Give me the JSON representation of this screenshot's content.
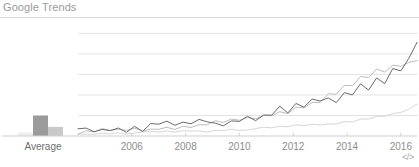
{
  "widget": {
    "title": "Google Trends",
    "embed_icon_label": "</>",
    "embed_icon_name": "code-embed-icon"
  },
  "colors": {
    "title": "#9a9a9a",
    "rule": "#d9d9d9",
    "gridline": "#e3e3e3",
    "axis": "#cfcfcf",
    "tick_label": "#8d8d8d",
    "bar_dark": "#9b9b9b",
    "bar_mid": "#c9c9c9",
    "bar_faint": "#efefef",
    "series_dark": "#6b6b6b",
    "series_mid": "#bdbdbd",
    "series_pale": "#d6d6d6"
  },
  "chart_data": {
    "type": "line",
    "title": "Google Trends",
    "xlabel": "",
    "ylabel": "",
    "grid": true,
    "legend": "none",
    "xlim": [
      2004.0,
      2016.6
    ],
    "ylim": [
      0,
      100
    ],
    "gridline_values": [
      90,
      72,
      54,
      36,
      18
    ],
    "xticks": [
      2006,
      2008,
      2010,
      2012,
      2014,
      2016
    ],
    "xticklabels": [
      "2006",
      "2008",
      "2010",
      "2012",
      "2014",
      "2016"
    ],
    "average_panel": {
      "label": "Average",
      "categories": [
        "series-pale",
        "series-dark",
        "series-mid"
      ],
      "values": [
        3,
        18,
        8
      ]
    },
    "series": [
      {
        "name": "series-dark",
        "color": "#6b6b6b",
        "x": [
          2004.0,
          2004.3,
          2004.6,
          2004.9,
          2005.2,
          2005.5,
          2005.8,
          2006.1,
          2006.4,
          2006.7,
          2007.0,
          2007.3,
          2007.6,
          2007.9,
          2008.2,
          2008.5,
          2008.8,
          2009.1,
          2009.4,
          2009.7,
          2010.0,
          2010.3,
          2010.6,
          2010.9,
          2011.2,
          2011.5,
          2011.8,
          2012.1,
          2012.4,
          2012.7,
          2013.0,
          2013.3,
          2013.6,
          2013.9,
          2014.2,
          2014.5,
          2014.8,
          2015.1,
          2015.4,
          2015.7,
          2016.0,
          2016.3,
          2016.6
        ],
        "y": [
          5,
          6,
          4,
          7,
          5,
          8,
          6,
          9,
          7,
          10,
          8,
          11,
          9,
          12,
          10,
          13,
          11,
          14,
          12,
          16,
          14,
          18,
          16,
          21,
          18,
          23,
          20,
          26,
          24,
          30,
          28,
          35,
          32,
          40,
          37,
          46,
          43,
          52,
          48,
          58,
          55,
          68,
          82
        ]
      },
      {
        "name": "series-mid",
        "color": "#bdbdbd",
        "x": [
          2004.0,
          2004.3,
          2004.6,
          2004.9,
          2005.2,
          2005.5,
          2005.8,
          2006.1,
          2006.4,
          2006.7,
          2007.0,
          2007.3,
          2007.6,
          2007.9,
          2008.2,
          2008.5,
          2008.8,
          2009.1,
          2009.4,
          2009.7,
          2010.0,
          2010.3,
          2010.6,
          2010.9,
          2011.2,
          2011.5,
          2011.8,
          2012.1,
          2012.4,
          2012.7,
          2013.0,
          2013.3,
          2013.6,
          2013.9,
          2014.2,
          2014.5,
          2014.8,
          2015.1,
          2015.4,
          2015.7,
          2016.0,
          2016.3,
          2016.6
        ],
        "y": [
          3,
          4,
          3,
          5,
          4,
          5,
          4,
          6,
          5,
          7,
          6,
          8,
          7,
          9,
          8,
          10,
          9,
          12,
          11,
          14,
          13,
          16,
          15,
          19,
          18,
          22,
          21,
          26,
          25,
          31,
          30,
          37,
          36,
          44,
          43,
          51,
          50,
          58,
          57,
          63,
          62,
          66,
          67
        ]
      },
      {
        "name": "series-pale",
        "color": "#d6d6d6",
        "x": [
          2004.0,
          2004.3,
          2004.6,
          2004.9,
          2005.2,
          2005.5,
          2005.8,
          2006.1,
          2006.4,
          2006.7,
          2007.0,
          2007.3,
          2007.6,
          2007.9,
          2008.2,
          2008.5,
          2008.8,
          2009.1,
          2009.4,
          2009.7,
          2010.0,
          2010.3,
          2010.6,
          2010.9,
          2011.2,
          2011.5,
          2011.8,
          2012.1,
          2012.4,
          2012.7,
          2013.0,
          2013.3,
          2013.6,
          2013.9,
          2014.2,
          2014.5,
          2014.8,
          2015.1,
          2015.4,
          2015.7,
          2016.0,
          2016.3,
          2016.6
        ],
        "y": [
          2,
          2,
          2,
          3,
          2,
          3,
          2,
          3,
          3,
          4,
          3,
          4,
          3,
          4,
          4,
          5,
          4,
          5,
          5,
          6,
          5,
          6,
          6,
          7,
          7,
          8,
          8,
          9,
          9,
          10,
          10,
          11,
          11,
          13,
          13,
          15,
          15,
          17,
          17,
          19,
          20,
          23,
          28
        ]
      }
    ]
  }
}
